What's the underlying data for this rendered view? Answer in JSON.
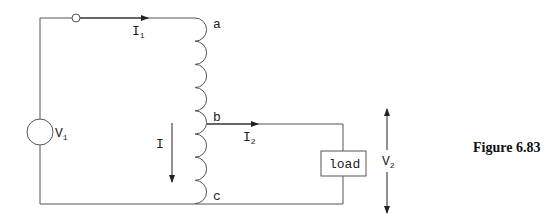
{
  "figure": {
    "caption": "Figure 6.83",
    "nodes": {
      "a": "a",
      "b": "b",
      "c": "c"
    },
    "source": {
      "label": "V",
      "sub": "1"
    },
    "load": {
      "label": "load"
    },
    "currents": {
      "i1": {
        "label": "I",
        "sub": "1"
      },
      "i2": {
        "label": "I",
        "sub": "2"
      },
      "i": {
        "label": "I"
      }
    },
    "output_voltage": {
      "label": "V",
      "sub": "2"
    },
    "colors": {
      "line": "#555555",
      "text": "#222222"
    }
  }
}
